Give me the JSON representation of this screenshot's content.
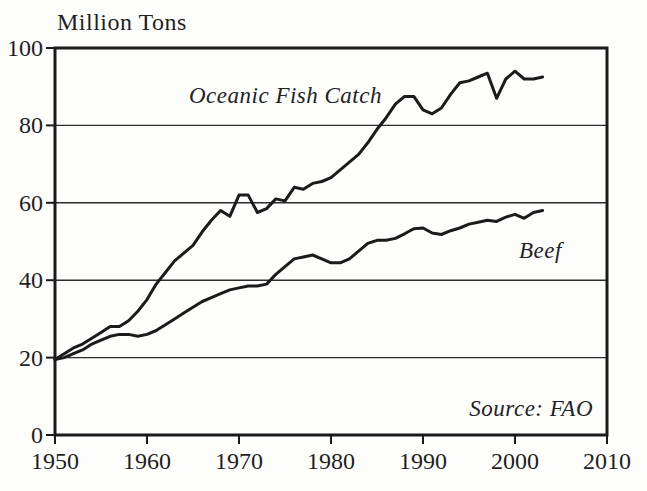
{
  "figure": {
    "title": "Million Tons",
    "source": "Source: FAO"
  },
  "chart_data": {
    "type": "line",
    "title": "Million Tons",
    "ylabel": "Million Tons",
    "source": "Source: FAO",
    "grid": "horizontal",
    "legend_position": "inline-labels",
    "xlim": [
      1950,
      2010
    ],
    "ylim": [
      0,
      100
    ],
    "xticks": [
      1950,
      1960,
      1970,
      1980,
      1990,
      2000,
      2010
    ],
    "yticks": [
      0,
      20,
      40,
      60,
      80,
      100
    ],
    "x": [
      1950,
      1951,
      1952,
      1953,
      1954,
      1955,
      1956,
      1957,
      1958,
      1959,
      1960,
      1961,
      1962,
      1963,
      1964,
      1965,
      1966,
      1967,
      1968,
      1969,
      1970,
      1971,
      1972,
      1973,
      1974,
      1975,
      1976,
      1977,
      1978,
      1979,
      1980,
      1981,
      1982,
      1983,
      1984,
      1985,
      1986,
      1987,
      1988,
      1989,
      1990,
      1991,
      1992,
      1993,
      1994,
      1995,
      1996,
      1997,
      1998,
      1999,
      2000,
      2001,
      2002,
      2003
    ],
    "series": [
      {
        "name": "Oceanic Fish Catch",
        "values": [
          19.5,
          21,
          22.5,
          23.5,
          25,
          26.5,
          28,
          28,
          29.5,
          32,
          35,
          39,
          42,
          45,
          47,
          49,
          52.5,
          55.5,
          58,
          56.5,
          62,
          62,
          57.5,
          58.5,
          61,
          60.5,
          64,
          63.5,
          65,
          65.5,
          66.5,
          68.5,
          70.5,
          72.5,
          75.5,
          79,
          82,
          85.5,
          87.5,
          87.5,
          84,
          83,
          84.5,
          88,
          91,
          91.5,
          92.5,
          93.5,
          87,
          92,
          94,
          92,
          92,
          92.5
        ]
      },
      {
        "name": "Beef",
        "values": [
          19.5,
          20,
          21,
          22,
          23.5,
          24.5,
          25.5,
          26,
          26,
          25.5,
          26,
          27,
          28.5,
          30,
          31.5,
          33,
          34.5,
          35.5,
          36.5,
          37.5,
          38,
          38.5,
          38.5,
          39,
          41.5,
          43.5,
          45.5,
          46,
          46.5,
          45.5,
          44.5,
          44.5,
          45.5,
          47.5,
          49.5,
          50.3,
          50.3,
          50.8,
          52,
          53.3,
          53.5,
          52.2,
          51.8,
          52.8,
          53.5,
          54.5,
          55,
          55.5,
          55.2,
          56.3,
          57,
          56,
          57.5,
          58
        ]
      }
    ],
    "line_color": "#1b1b1b"
  }
}
